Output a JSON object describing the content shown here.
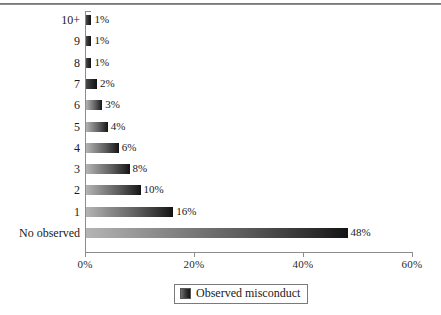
{
  "figure": {
    "background_color": "#ffffff",
    "ink_color": "#1a1a1a",
    "axis_color": "#8c8c8c"
  },
  "legend": {
    "swatch_name": "series-swatch",
    "label": "Observed misconduct",
    "position": "bottom-center",
    "boxed": true
  },
  "chart_data": {
    "type": "bar",
    "orientation": "horizontal",
    "title": "",
    "subtitle": "",
    "xlabel": "",
    "ylabel": "",
    "categories": [
      "10+",
      "9",
      "8",
      "7",
      "6",
      "5",
      "4",
      "3",
      "2",
      "1",
      "No observed"
    ],
    "values": [
      1,
      1,
      1,
      2,
      3,
      4,
      6,
      8,
      10,
      16,
      48
    ],
    "value_labels": [
      "1%",
      "1%",
      "1%",
      "2%",
      "3%",
      "4%",
      "6%",
      "8%",
      "10%",
      "16%",
      "48%"
    ],
    "series": [
      {
        "name": "Observed misconduct",
        "values": [
          1,
          1,
          1,
          2,
          3,
          4,
          6,
          8,
          10,
          16,
          48
        ]
      }
    ],
    "xlim": [
      0,
      60
    ],
    "xticks": [
      0,
      20,
      40,
      60
    ],
    "xtick_labels": [
      "0%",
      "20%",
      "40%",
      "60%"
    ],
    "grid": false,
    "legend_position": "bottom-center",
    "bar_style": "grayscale-gradient",
    "data_labels": true
  }
}
